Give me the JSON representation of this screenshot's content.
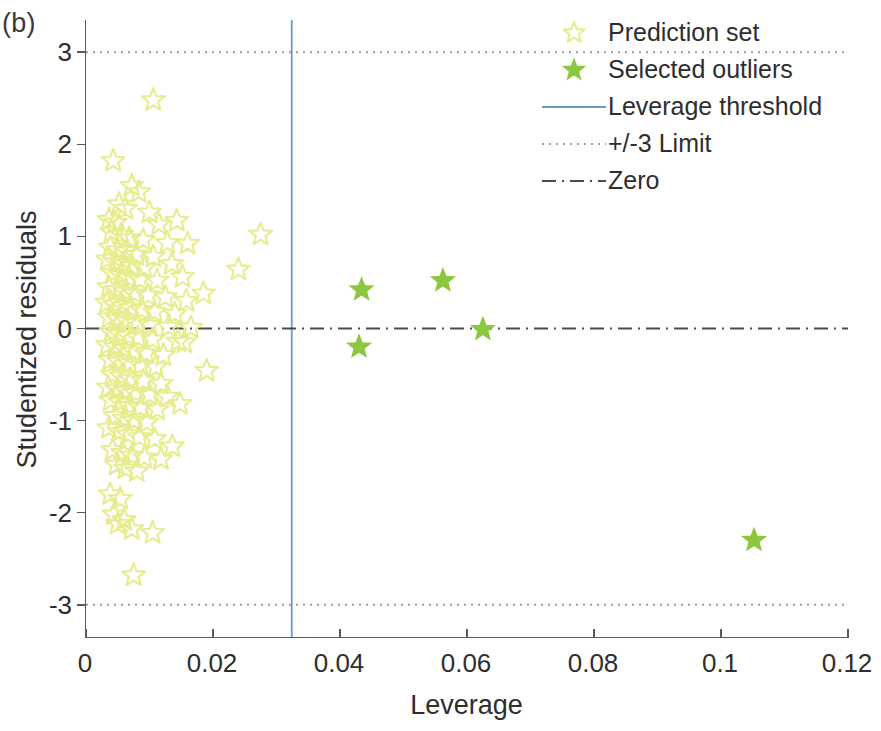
{
  "panel_label": "(b)",
  "legend": {
    "position": "top-right",
    "items": [
      {
        "label": "Prediction set",
        "key": "star-outline",
        "color": "#e8ec8e"
      },
      {
        "label": "Selected outliers",
        "key": "star-filled",
        "color": "#8dc63f"
      },
      {
        "label": "Leverage threshold",
        "key": "solid-line",
        "color": "#6b9ac4"
      },
      {
        "label": "+/-3 Limit",
        "key": "dotted-line",
        "color": "#9aa0a6"
      },
      {
        "label": "Zero",
        "key": "dashdot-line",
        "color": "#4a4a4a"
      }
    ]
  },
  "chart_data": {
    "type": "scatter",
    "title": "",
    "xlabel": "Leverage",
    "ylabel": "Studentized residuals",
    "xlim": [
      0,
      0.12
    ],
    "ylim": [
      -3.35,
      3.35
    ],
    "xticks": [
      0,
      0.02,
      0.04,
      0.06,
      0.08,
      0.1,
      0.12
    ],
    "xticklabels": [
      "0",
      "0.02",
      "0.04",
      "0.06",
      "0.08",
      "0.1",
      "0.12"
    ],
    "yticks": [
      3,
      2,
      1,
      0,
      -1,
      -2,
      -3
    ],
    "yticklabels": [
      "3",
      "2",
      "1",
      "0",
      "-1",
      "-2",
      "-3"
    ],
    "grid": false,
    "reference_lines": [
      {
        "name": "Leverage threshold",
        "orientation": "vertical",
        "value": 0.0324,
        "style": "solid",
        "color": "#6b9ac4"
      },
      {
        "name": "+3 Limit",
        "orientation": "horizontal",
        "value": 3,
        "style": "dotted",
        "color": "#9aa0a6"
      },
      {
        "name": "-3 Limit",
        "orientation": "horizontal",
        "value": -3,
        "style": "dotted",
        "color": "#9aa0a6"
      },
      {
        "name": "Zero",
        "orientation": "horizontal",
        "value": 0,
        "style": "dashdot",
        "color": "#4a4a4a"
      }
    ],
    "series": [
      {
        "name": "Prediction set",
        "marker": "star-outline",
        "color": "#e8ec8e",
        "points": [
          [
            0.0106,
            2.48
          ],
          [
            0.0043,
            1.82
          ],
          [
            0.0072,
            1.55
          ],
          [
            0.0083,
            1.48
          ],
          [
            0.0052,
            1.35
          ],
          [
            0.0062,
            1.3
          ],
          [
            0.01,
            1.26
          ],
          [
            0.0036,
            1.18
          ],
          [
            0.0046,
            1.15
          ],
          [
            0.0115,
            1.13
          ],
          [
            0.0143,
            1.17
          ],
          [
            0.0275,
            1.02
          ],
          [
            0.004,
            1.05
          ],
          [
            0.0056,
            1.02
          ],
          [
            0.0068,
            0.98
          ],
          [
            0.009,
            0.96
          ],
          [
            0.0128,
            0.93
          ],
          [
            0.016,
            0.92
          ],
          [
            0.0038,
            0.88
          ],
          [
            0.005,
            0.85
          ],
          [
            0.0064,
            0.84
          ],
          [
            0.0079,
            0.8
          ],
          [
            0.0106,
            0.78
          ],
          [
            0.0034,
            0.75
          ],
          [
            0.0047,
            0.72
          ],
          [
            0.006,
            0.7
          ],
          [
            0.0072,
            0.68
          ],
          [
            0.0092,
            0.66
          ],
          [
            0.0135,
            0.7
          ],
          [
            0.024,
            0.64
          ],
          [
            0.0042,
            0.6
          ],
          [
            0.0055,
            0.58
          ],
          [
            0.0067,
            0.55
          ],
          [
            0.0085,
            0.53
          ],
          [
            0.0112,
            0.52
          ],
          [
            0.0152,
            0.56
          ],
          [
            0.0185,
            0.38
          ],
          [
            0.0036,
            0.45
          ],
          [
            0.0048,
            0.42
          ],
          [
            0.0062,
            0.4
          ],
          [
            0.0076,
            0.38
          ],
          [
            0.0098,
            0.36
          ],
          [
            0.0125,
            0.34
          ],
          [
            0.0158,
            0.3
          ],
          [
            0.0033,
            0.28
          ],
          [
            0.0045,
            0.26
          ],
          [
            0.0058,
            0.24
          ],
          [
            0.007,
            0.22
          ],
          [
            0.0088,
            0.2
          ],
          [
            0.0108,
            0.18
          ],
          [
            0.014,
            0.16
          ],
          [
            0.0037,
            0.12
          ],
          [
            0.005,
            0.1
          ],
          [
            0.0064,
            0.08
          ],
          [
            0.008,
            0.06
          ],
          [
            0.01,
            0.04
          ],
          [
            0.013,
            0.02
          ],
          [
            0.0165,
            0.01
          ],
          [
            0.004,
            -0.04
          ],
          [
            0.0053,
            -0.06
          ],
          [
            0.0066,
            -0.08
          ],
          [
            0.0082,
            -0.1
          ],
          [
            0.0105,
            -0.12
          ],
          [
            0.0145,
            -0.14
          ],
          [
            0.0034,
            -0.18
          ],
          [
            0.0047,
            -0.2
          ],
          [
            0.006,
            -0.22
          ],
          [
            0.0075,
            -0.25
          ],
          [
            0.0095,
            -0.27
          ],
          [
            0.0122,
            -0.29
          ],
          [
            0.0155,
            -0.15
          ],
          [
            0.0038,
            -0.34
          ],
          [
            0.0052,
            -0.36
          ],
          [
            0.0068,
            -0.38
          ],
          [
            0.0086,
            -0.4
          ],
          [
            0.011,
            -0.42
          ],
          [
            0.019,
            -0.46
          ],
          [
            0.0042,
            -0.5
          ],
          [
            0.0056,
            -0.52
          ],
          [
            0.007,
            -0.55
          ],
          [
            0.009,
            -0.57
          ],
          [
            0.0118,
            -0.6
          ],
          [
            0.0035,
            -0.64
          ],
          [
            0.0049,
            -0.66
          ],
          [
            0.0063,
            -0.68
          ],
          [
            0.0078,
            -0.7
          ],
          [
            0.01,
            -0.72
          ],
          [
            0.0128,
            -0.74
          ],
          [
            0.0039,
            -0.78
          ],
          [
            0.0054,
            -0.8
          ],
          [
            0.0148,
            -0.82
          ],
          [
            0.0068,
            -0.84
          ],
          [
            0.0086,
            -0.86
          ],
          [
            0.0112,
            -0.88
          ],
          [
            0.0046,
            -0.95
          ],
          [
            0.006,
            -0.98
          ],
          [
            0.0075,
            -1.0
          ],
          [
            0.0096,
            -1.02
          ],
          [
            0.0036,
            -1.08
          ],
          [
            0.0052,
            -1.12
          ],
          [
            0.0066,
            -1.15
          ],
          [
            0.0084,
            -1.18
          ],
          [
            0.0108,
            -1.2
          ],
          [
            0.0136,
            -1.28
          ],
          [
            0.0042,
            -1.32
          ],
          [
            0.0058,
            -1.35
          ],
          [
            0.0072,
            -1.38
          ],
          [
            0.0092,
            -1.4
          ],
          [
            0.0118,
            -1.42
          ],
          [
            0.0048,
            -1.48
          ],
          [
            0.0062,
            -1.52
          ],
          [
            0.008,
            -1.55
          ],
          [
            0.0038,
            -1.8
          ],
          [
            0.0054,
            -1.85
          ],
          [
            0.0044,
            -2.02
          ],
          [
            0.006,
            -2.08
          ],
          [
            0.005,
            -2.12
          ],
          [
            0.0072,
            -2.18
          ],
          [
            0.0105,
            -2.22
          ],
          [
            0.0075,
            -2.68
          ]
        ]
      },
      {
        "name": "Selected outliers",
        "marker": "star-filled",
        "color": "#8dc63f",
        "points": [
          [
            0.0434,
            0.42
          ],
          [
            0.0562,
            0.52
          ],
          [
            0.0625,
            -0.01
          ],
          [
            0.043,
            -0.2
          ],
          [
            0.1052,
            -2.3
          ]
        ]
      }
    ]
  }
}
